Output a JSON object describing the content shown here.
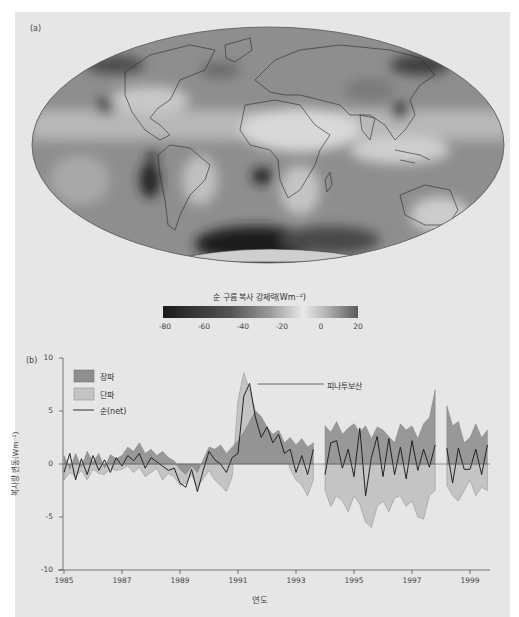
{
  "panel_a": {
    "label": "(a)",
    "map": {
      "projection": "Mollweide",
      "description": "Global map of net cloud radiative forcing"
    },
    "colorbar": {
      "title": "순 구름 복사 강제력(Wm⁻²)",
      "ticks": [
        "-80",
        "-60",
        "-40",
        "-20",
        "0",
        "20"
      ],
      "range": [
        -80,
        20
      ]
    }
  },
  "panel_b": {
    "label": "(b)",
    "legend": [
      {
        "label": "장파",
        "color": "#8f8f8f",
        "type": "area"
      },
      {
        "label": "단파",
        "color": "#c4c4c4",
        "type": "area"
      },
      {
        "label": "순(net)",
        "color": "#222222",
        "type": "line"
      }
    ],
    "annotation": "피나투보산",
    "ylabel": "복사량 변동(Wm⁻²)",
    "xlabel": "연도",
    "yticks": [
      "10",
      "5",
      "0",
      "-5",
      "-10"
    ],
    "xticks": [
      "1985",
      "1987",
      "1989",
      "1991",
      "1993",
      "1995",
      "1997",
      "1999"
    ]
  },
  "chart_data": [
    {
      "type": "heatmap",
      "title": "순 구름 복사 강제력(Wm⁻²)",
      "subtype": "map",
      "colorbar_range": [
        -80,
        20
      ],
      "colorbar_ticks": [
        -80,
        -60,
        -40,
        -20,
        0,
        20
      ],
      "notes": "Strongest negative forcing (dark) over Southern Ocean, stratocumulus regions off Peru/Namibia, East China; near-zero/positive (light) over deserts and tropics"
    },
    {
      "type": "area",
      "title": "",
      "xlabel": "연도",
      "ylabel": "복사량 변동(Wm⁻²)",
      "ylim": [
        -10,
        10
      ],
      "xlim": [
        1985,
        1999.8
      ],
      "xticks": [
        1985,
        1987,
        1989,
        1991,
        1993,
        1995,
        1997,
        1999
      ],
      "yticks": [
        -10,
        -5,
        0,
        5,
        10
      ],
      "legend_position": "upper left",
      "annotation": {
        "text": "피나투보산",
        "x": 1991.6,
        "y": 7.5
      },
      "x": [
        1985.0,
        1985.2,
        1985.4,
        1985.6,
        1985.8,
        1986.0,
        1986.2,
        1986.4,
        1986.6,
        1986.8,
        1987.0,
        1987.2,
        1987.4,
        1987.6,
        1987.8,
        1988.0,
        1988.2,
        1988.4,
        1988.6,
        1988.8,
        1989.0,
        1989.2,
        1989.4,
        1989.6,
        1989.8,
        1990.0,
        1990.2,
        1990.4,
        1990.6,
        1990.8,
        1991.0,
        1991.2,
        1991.4,
        1991.6,
        1991.8,
        1992.0,
        1992.2,
        1992.4,
        1992.6,
        1992.8,
        1993.0,
        1993.2,
        1993.4,
        1993.6,
        1994.0,
        1994.2,
        1994.4,
        1994.6,
        1994.8,
        1995.0,
        1995.2,
        1995.4,
        1995.6,
        1995.8,
        1996.0,
        1996.2,
        1996.4,
        1996.6,
        1996.8,
        1997.0,
        1997.2,
        1997.4,
        1997.6,
        1997.8,
        1998.2,
        1998.4,
        1998.6,
        1998.8,
        1999.0,
        1999.2,
        1999.4,
        1999.6
      ],
      "series": [
        {
          "name": "장파",
          "values": [
            0.8,
            -0.5,
            1.0,
            -0.3,
            1.2,
            0.2,
            1.0,
            -0.4,
            0.9,
            0.5,
            0.8,
            1.6,
            1.2,
            2.0,
            1.0,
            1.4,
            0.8,
            1.2,
            0.6,
            0.3,
            -0.5,
            -1.0,
            -0.2,
            -0.8,
            0.4,
            1.6,
            1.4,
            1.8,
            1.0,
            1.6,
            2.2,
            3.0,
            4.0,
            5.0,
            4.5,
            3.5,
            2.8,
            3.2,
            2.0,
            2.5,
            1.8,
            2.4,
            1.6,
            2.0,
            3.6,
            3.0,
            4.0,
            2.8,
            3.4,
            3.8,
            3.0,
            3.6,
            2.4,
            3.5,
            3.2,
            2.6,
            2.0,
            3.8,
            3.2,
            3.6,
            2.4,
            3.8,
            4.4,
            7.0,
            5.5,
            3.6,
            4.0,
            2.0,
            2.5,
            3.8,
            2.5,
            3.2
          ]
        },
        {
          "name": "단파",
          "values": [
            -1.5,
            -0.8,
            -1.2,
            -0.6,
            -1.5,
            -0.5,
            -0.9,
            -1.0,
            -0.4,
            -0.6,
            -0.5,
            -0.2,
            -0.8,
            -0.3,
            -1.2,
            -0.8,
            -0.4,
            -1.5,
            -0.9,
            -1.2,
            -2.0,
            -1.8,
            -1.0,
            -2.2,
            -1.4,
            -0.6,
            -1.5,
            -2.0,
            -2.6,
            -1.2,
            6.0,
            8.6,
            7.0,
            5.0,
            4.2,
            3.0,
            2.4,
            2.2,
            1.6,
            -0.5,
            -1.5,
            -2.0,
            -3.0,
            -1.5,
            -2.5,
            -4.0,
            -3.0,
            -3.5,
            -4.5,
            -3.0,
            -3.8,
            -5.5,
            -6.0,
            -4.0,
            -3.5,
            -4.5,
            -3.2,
            -3.0,
            -4.0,
            -3.5,
            -5.0,
            -5.2,
            -3.0,
            -2.5,
            -2.0,
            -3.0,
            -3.5,
            -2.5,
            -1.5,
            -3.0,
            -2.2,
            -2.5
          ]
        },
        {
          "name": "순(net)",
          "values": [
            -0.8,
            1.0,
            -1.5,
            0.5,
            -1.0,
            0.8,
            -0.6,
            0.4,
            -0.8,
            0.6,
            -0.2,
            0.8,
            0.3,
            1.0,
            -0.4,
            0.6,
            0.2,
            -0.2,
            -0.6,
            -0.4,
            -1.8,
            -2.2,
            -0.5,
            -2.6,
            -0.6,
            1.2,
            0.4,
            0.0,
            -0.8,
            0.6,
            1.0,
            6.4,
            7.6,
            4.4,
            2.5,
            3.5,
            2.0,
            2.8,
            1.0,
            1.4,
            -0.8,
            0.8,
            -1.0,
            1.4,
            -1.0,
            2.0,
            2.2,
            -0.4,
            1.4,
            -1.2,
            3.4,
            -3.0,
            0.6,
            2.6,
            -1.2,
            2.4,
            -1.0,
            1.6,
            -1.4,
            2.2,
            -0.6,
            1.4,
            -0.3,
            1.8,
            1.5,
            -1.8,
            1.5,
            -0.5,
            -0.5,
            1.4,
            -1.0,
            1.8
          ]
        }
      ]
    }
  ]
}
